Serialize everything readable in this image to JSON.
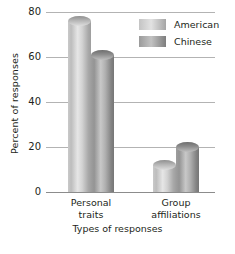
{
  "chart_data": {
    "type": "bar",
    "title": "",
    "xlabel": "Types of responses",
    "ylabel": "Percent of responses",
    "categories": [
      "Personal traits",
      "Group affiliations"
    ],
    "category_lines": [
      [
        "Personal",
        "traits"
      ],
      [
        "Group",
        "affiliations"
      ]
    ],
    "series": [
      {
        "name": "American",
        "values": [
          76,
          12
        ],
        "color": "#c9c9c9"
      },
      {
        "name": "Chinese",
        "values": [
          61,
          20
        ],
        "color": "#9a9a9a"
      }
    ],
    "ylim": [
      0,
      80
    ],
    "yticks": [
      80,
      60,
      40,
      20,
      0
    ],
    "ytick_labels": [
      "80",
      "60",
      "40",
      "20",
      "0"
    ],
    "grid": true,
    "legend_position": "top-right",
    "bar_style": "cylinder"
  },
  "axes": {
    "y_title": "Percent of responses",
    "x_title": "Types of responses"
  },
  "legend": {
    "items": [
      {
        "label": "American"
      },
      {
        "label": "Chinese"
      }
    ]
  }
}
